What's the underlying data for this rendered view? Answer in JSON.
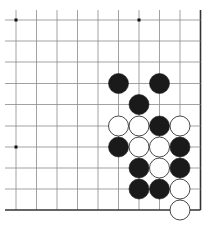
{
  "board": {
    "description": "Go problem diagram, lower-right corner view",
    "grid": {
      "x_lines": [
        16,
        36.5,
        57,
        77.5,
        98,
        118.5,
        139,
        159.5,
        180,
        200.5
      ],
      "y_lines": [
        20,
        41,
        62,
        83.5,
        104.5,
        126,
        147,
        168,
        189,
        210
      ],
      "right_edge_col": 9,
      "bottom_edge_row": 9,
      "line_color": "#8a8a8a",
      "edge_color": "#333333"
    },
    "star_points": [
      {
        "col": 0,
        "row": 0
      },
      {
        "col": 6,
        "row": 0
      },
      {
        "col": 0,
        "row": 6
      }
    ],
    "stones": [
      {
        "color": "black",
        "col": 5,
        "row": 3
      },
      {
        "color": "black",
        "col": 7,
        "row": 3
      },
      {
        "color": "black",
        "col": 6,
        "row": 4
      },
      {
        "color": "white",
        "col": 5,
        "row": 5
      },
      {
        "color": "white",
        "col": 6,
        "row": 5
      },
      {
        "color": "black",
        "col": 7,
        "row": 5
      },
      {
        "color": "white",
        "col": 8,
        "row": 5
      },
      {
        "color": "black",
        "col": 5,
        "row": 6
      },
      {
        "color": "white",
        "col": 6,
        "row": 6
      },
      {
        "color": "white",
        "col": 7,
        "row": 6
      },
      {
        "color": "black",
        "col": 8,
        "row": 6
      },
      {
        "color": "black",
        "col": 6,
        "row": 7
      },
      {
        "color": "white",
        "col": 7,
        "row": 7
      },
      {
        "color": "black",
        "col": 8,
        "row": 7
      },
      {
        "color": "black",
        "col": 6,
        "row": 8
      },
      {
        "color": "black",
        "col": 7,
        "row": 8
      },
      {
        "color": "white",
        "col": 8,
        "row": 8
      },
      {
        "color": "white",
        "col": 8,
        "row": 9
      }
    ],
    "stone_radius": 10,
    "colors": {
      "black_stone": "#1a1a1a",
      "white_stone": "#ffffff",
      "white_outline": "#333333"
    }
  }
}
